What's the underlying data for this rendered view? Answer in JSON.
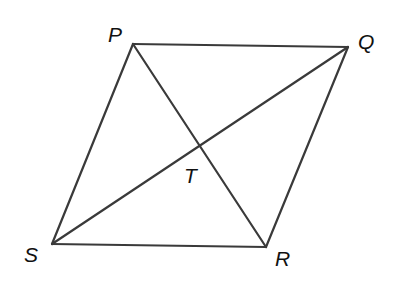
{
  "figure": {
    "type": "parallelogram-with-diagonals",
    "vertices": {
      "P": {
        "x": 133,
        "y": 44
      },
      "Q": {
        "x": 348,
        "y": 47
      },
      "R": {
        "x": 266,
        "y": 247
      },
      "S": {
        "x": 52,
        "y": 244
      },
      "T": {
        "x": 200,
        "y": 146
      }
    },
    "sides": [
      {
        "name": "PQ",
        "from": "P",
        "to": "Q"
      },
      {
        "name": "QR",
        "from": "Q",
        "to": "R"
      },
      {
        "name": "RS",
        "from": "R",
        "to": "S"
      },
      {
        "name": "SP",
        "from": "S",
        "to": "P"
      }
    ],
    "diagonals": [
      {
        "name": "PR",
        "from": "P",
        "to": "R"
      },
      {
        "name": "SQ",
        "from": "S",
        "to": "Q"
      }
    ],
    "intersection": "T",
    "labels": [
      {
        "id": "P",
        "text": "P",
        "x": 108,
        "y": 42
      },
      {
        "id": "Q",
        "text": "Q",
        "x": 358,
        "y": 49
      },
      {
        "id": "S",
        "text": "S",
        "x": 24,
        "y": 262
      },
      {
        "id": "R",
        "text": "R",
        "x": 275,
        "y": 266
      },
      {
        "id": "T",
        "text": "T",
        "x": 184,
        "y": 183
      }
    ],
    "line_color": "#3a3a3a",
    "label_color": "#111111"
  }
}
